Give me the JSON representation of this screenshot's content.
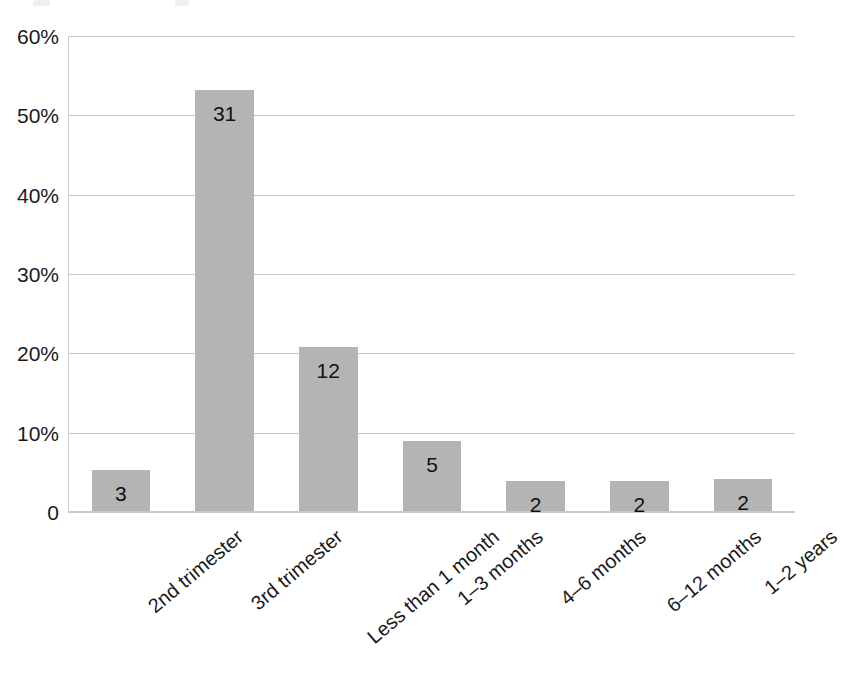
{
  "chart_data": {
    "type": "bar",
    "title": "",
    "subtitle": "",
    "xlabel": "",
    "ylabel": "",
    "categories": [
      "2nd trimester",
      "3rd trimester",
      "Less than 1 month",
      "1–3 months",
      "4–6 months",
      "6–12 months",
      "1–2 years"
    ],
    "values": [
      5.2,
      53.2,
      20.7,
      8.8,
      3.8,
      3.8,
      4.0
    ],
    "point_labels": [
      "3",
      "31",
      "12",
      "5",
      "2",
      "2",
      "2"
    ],
    "ylim": [
      0,
      60
    ],
    "yticks": [
      0,
      10,
      20,
      30,
      40,
      50,
      60
    ],
    "ytick_labels": [
      "0",
      "10%",
      "20%",
      "30%",
      "40%",
      "50%",
      "60%"
    ],
    "grid": true,
    "legend": false,
    "legend_position": "none",
    "bar_color": "#b4b4b4",
    "gridline_color": "#c9c9c9",
    "text_color": "#1a1a1a",
    "background_color": "#ffffff",
    "xtick_rotation_degrees": -40
  }
}
